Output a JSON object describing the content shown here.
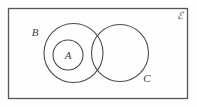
{
  "diagram": {
    "kind": "venn-diagram",
    "background_color": "#fefefe",
    "stroke_color": "#4a4a4a",
    "label_color": "#3f3f42",
    "universe": {
      "label": "ℰ",
      "label_name": "universal-set-symbol",
      "label_x": 180,
      "label_y": 19,
      "rect": {
        "x": 8.5,
        "y": 8.5,
        "width": 179,
        "height": 90
      }
    },
    "sets": [
      {
        "id": "B",
        "label": "B",
        "cx": 73.5,
        "cy": 53,
        "r": 29.5,
        "label_x": 35,
        "label_y": 36
      },
      {
        "id": "A",
        "label": "A",
        "cx": 68,
        "cy": 55,
        "r": 15,
        "label_x": 68,
        "label_y": 59
      },
      {
        "id": "C",
        "label": "C",
        "cx": 120,
        "cy": 53,
        "r": 28.5,
        "label_x": 147,
        "label_y": 82
      }
    ]
  }
}
